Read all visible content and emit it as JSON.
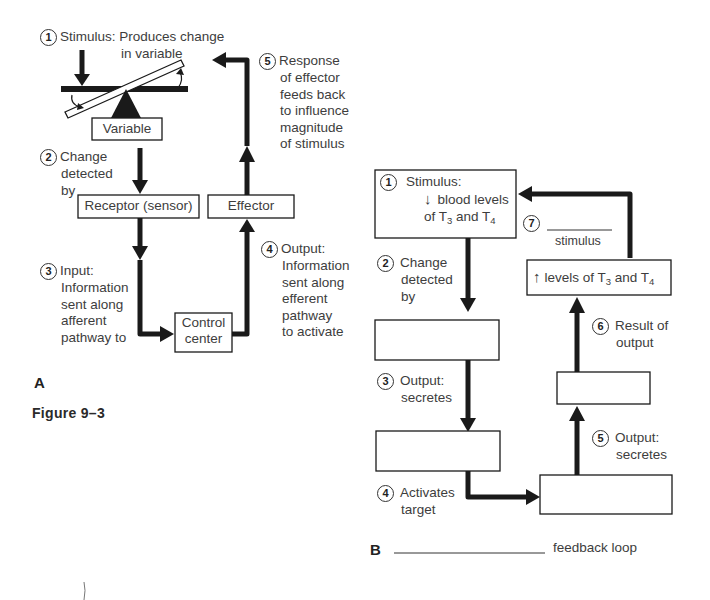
{
  "figure": {
    "label": "Figure 9–3"
  },
  "panel_a": {
    "label": "A",
    "steps": {
      "s1": {
        "num": "1",
        "line1": "Stimulus: Produces change",
        "line2": "in variable"
      },
      "s2": {
        "num": "2",
        "line1": "Change",
        "line2": "detected",
        "line3": "by"
      },
      "s3": {
        "num": "3",
        "line1": "Input:",
        "line2": "Information",
        "line3": "sent along",
        "line4": "afferent",
        "line5": "pathway to"
      },
      "s4": {
        "num": "4",
        "line1": "Output:",
        "line2": "Information",
        "line3": "sent along",
        "line4": "efferent",
        "line5": "pathway",
        "line6": "to activate"
      },
      "s5": {
        "num": "5",
        "line1": "Response",
        "line2": "of effector",
        "line3": "feeds back",
        "line4": "to influence",
        "line5": "magnitude",
        "line6": "of stimulus"
      }
    },
    "boxes": {
      "variable": "Variable",
      "receptor": "Receptor (sensor)",
      "effector": "Effector",
      "control_line1": "Control",
      "control_line2": "center"
    }
  },
  "panel_b": {
    "label": "B",
    "footer_text": "feedback loop",
    "box1": {
      "num": "1",
      "line1": "Stimulus:",
      "arrow": "↓",
      "line2": "blood levels",
      "line3_pre": "of T",
      "sub1": "3",
      "line3_mid": " and T",
      "sub2": "4"
    },
    "step7": {
      "num": "7",
      "text": "stimulus"
    },
    "levels_box": {
      "arrow": "↑",
      "pre": "levels of T",
      "sub1": "3",
      "mid": " and T",
      "sub2": "4"
    },
    "steps": {
      "s2": {
        "num": "2",
        "line1": "Change",
        "line2": "detected",
        "line3": "by"
      },
      "s3": {
        "num": "3",
        "line1": "Output:",
        "line2": "secretes"
      },
      "s4": {
        "num": "4",
        "line1": "Activates",
        "line2": "target"
      },
      "s5": {
        "num": "5",
        "line1": "Output:",
        "line2": "secretes"
      },
      "s6": {
        "num": "6",
        "line1": "Result of",
        "line2": "output"
      }
    },
    "empty_boxes": [
      "receptor-blank",
      "gland1-blank",
      "gland2-blank",
      "result-blank",
      "target-blank"
    ]
  },
  "colors": {
    "line": "#1a1a1a",
    "text": "#3d3d3d",
    "background": "#ffffff"
  }
}
